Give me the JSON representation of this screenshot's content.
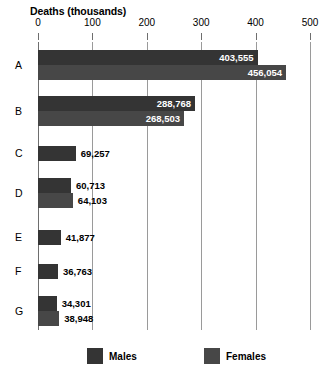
{
  "chart_data": {
    "type": "bar",
    "orientation": "horizontal",
    "title": "Deaths (thousands)",
    "xlabel": "Deaths (thousands)",
    "ylabel": "",
    "xlim": [
      0,
      500
    ],
    "xticks": [
      0,
      100,
      200,
      300,
      400,
      500
    ],
    "xtick_labels": [
      "0",
      "100",
      "200",
      "300",
      "400",
      "500"
    ],
    "grid": true,
    "grid_axis": "x",
    "legend_position": "bottom",
    "units": "thousands",
    "categories": [
      "A",
      "B",
      "C",
      "D",
      "E",
      "F",
      "G"
    ],
    "series": [
      {
        "name": "Males",
        "color": "#343434",
        "values": [
          403.555,
          288.768,
          69.257,
          60.713,
          41.877,
          36.763,
          34.301
        ],
        "labels": [
          "403,555",
          "288,768",
          "69,257",
          "60,713",
          "41,877",
          "36,763",
          "34,301"
        ]
      },
      {
        "name": "Females",
        "color": "#474747",
        "values": [
          456.054,
          268.503,
          null,
          64.103,
          null,
          null,
          38.948
        ],
        "labels": [
          "456,054",
          "268,503",
          null,
          "64,103",
          null,
          null,
          "38,948"
        ]
      }
    ]
  },
  "legend": {
    "items": [
      {
        "label": "Males",
        "color": "#343434"
      },
      {
        "label": "Females",
        "color": "#474747"
      }
    ]
  }
}
